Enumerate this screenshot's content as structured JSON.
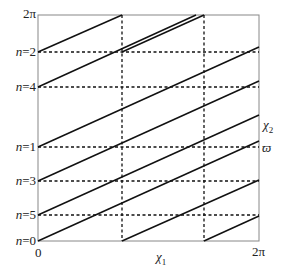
{
  "figure": {
    "frame": {
      "left": 38,
      "top": 15,
      "right": 259,
      "bottom": 241
    },
    "y_axis": {
      "top_label": "2π",
      "levels": [
        {
          "label": "n = 2",
          "n": "n",
          "eq": "=",
          "val": "2",
          "y": 52
        },
        {
          "label": "n = 4",
          "n": "n",
          "eq": "=",
          "val": "4",
          "y": 87
        },
        {
          "label": "n = 1",
          "n": "n",
          "eq": "=",
          "val": "1",
          "y": 147
        },
        {
          "label": "n = 3",
          "n": "n",
          "eq": "=",
          "val": "3",
          "y": 181
        },
        {
          "label": "n = 5",
          "n": "n",
          "eq": "=",
          "val": "5",
          "y": 215
        },
        {
          "label": "n = 0",
          "n": "n",
          "eq": "=",
          "val": "0",
          "y": 241
        }
      ]
    },
    "x_axis": {
      "origin_label": "0",
      "end_label": "2π",
      "axis_label": "χ",
      "axis_label_sub": "1",
      "vertical_dividers_x": [
        122,
        204
      ]
    },
    "right_labels": {
      "chi2": "χ",
      "chi2_sub": "2",
      "varpi": "ϖ"
    },
    "colors": {
      "line": "#111111",
      "frame": "#888888",
      "dash": "#111111"
    }
  }
}
